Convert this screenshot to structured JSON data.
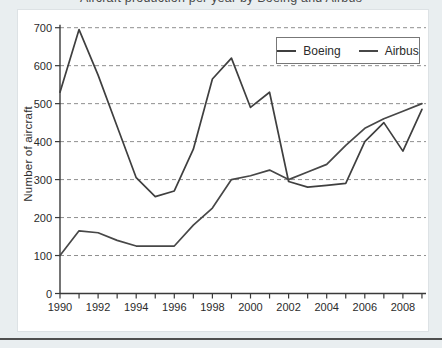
{
  "page": {
    "cropped_title": "Aircraft production per year by Boeing and Airbus",
    "background_color": "#e9eef0",
    "card_color": "#ffffff",
    "divider_color": "#4f4f4f"
  },
  "chart_data": {
    "type": "line",
    "title": "",
    "xlabel": "",
    "ylabel": "Number of aircraft",
    "x": [
      1990,
      1991,
      1992,
      1993,
      1994,
      1995,
      1996,
      1997,
      1998,
      1999,
      2000,
      2001,
      2002,
      2003,
      2004,
      2005,
      2006,
      2007,
      2008,
      2009
    ],
    "x_tick_labels": [
      "1990",
      "1992",
      "1994",
      "1996",
      "1998",
      "2000",
      "2002",
      "2004",
      "2006",
      "2008"
    ],
    "y_ticks": [
      0,
      100,
      200,
      300,
      400,
      500,
      600,
      700
    ],
    "ylim": [
      0,
      700
    ],
    "grid": "horizontal-dashed",
    "legend_position": "top-right-inside",
    "series": [
      {
        "name": "Boeing",
        "color": "#3f3f3f",
        "values": [
          530,
          695,
          575,
          440,
          305,
          255,
          270,
          380,
          565,
          620,
          490,
          530,
          295,
          280,
          285,
          290,
          400,
          450,
          375,
          485
        ]
      },
      {
        "name": "Airbus",
        "color": "#474747",
        "values": [
          100,
          165,
          160,
          140,
          125,
          125,
          125,
          180,
          225,
          300,
          310,
          325,
          300,
          320,
          340,
          390,
          435,
          460,
          480,
          500
        ]
      }
    ],
    "style": {
      "axis_color": "#3a3a3a",
      "grid_color": "#8f8f8f",
      "tick_text_color": "#2b2b2b"
    }
  }
}
